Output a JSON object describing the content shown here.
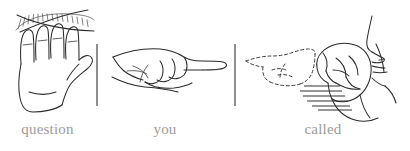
{
  "figure": {
    "background_color": "#ffffff",
    "ink_color": "#2b2b2b",
    "caption_color": "#9b9b9b",
    "width": 410,
    "height": 151,
    "phrase": "question you called"
  },
  "panels": [
    {
      "id": "panel-question",
      "index": 1,
      "caption": "question",
      "sign_description": "open flat hand, palm down, with radiating hatch lines and crossed arcs above the fingers",
      "icons": [
        "open-hand-icon",
        "hatch-arc-icon",
        "crossed-arc-icon"
      ]
    },
    {
      "id": "panel-you",
      "index": 2,
      "caption": "you",
      "sign_description": "closed hand with index finger extended pointing to the right",
      "icons": [
        "pointing-hand-icon"
      ]
    },
    {
      "id": "panel-called",
      "index": 3,
      "caption": "called",
      "sign_description": "dashed ghost of a pointing hand moving toward a closed fist held beside a face in profile, with motion speed lines",
      "icons": [
        "ghost-pointing-hand-icon",
        "fist-icon",
        "face-profile-icon",
        "motion-lines-icon"
      ]
    }
  ],
  "dividers": [
    {
      "id": "divider-1",
      "x": 97,
      "y_top": 44,
      "y_bottom": 106
    },
    {
      "id": "divider-2",
      "x": 235,
      "y_top": 44,
      "y_bottom": 106
    }
  ]
}
